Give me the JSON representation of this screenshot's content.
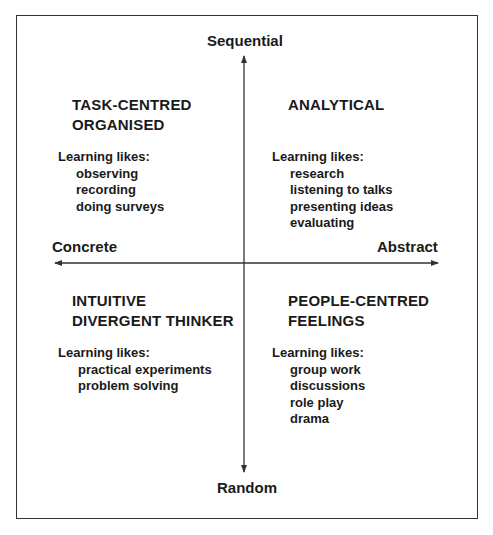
{
  "axes": {
    "top": "Sequential",
    "bottom": "Random",
    "left": "Concrete",
    "right": "Abstract"
  },
  "quadrants": [
    {
      "position": "top-left",
      "title_lines": [
        "TASK-CENTRED",
        "ORGANISED"
      ],
      "likes_label": "Learning likes:",
      "items": [
        "observing",
        "recording",
        "doing surveys"
      ]
    },
    {
      "position": "top-right",
      "title_lines": [
        "ANALYTICAL"
      ],
      "likes_label": "Learning likes:",
      "items": [
        "research",
        "listening to talks",
        "presenting ideas",
        "evaluating"
      ]
    },
    {
      "position": "bottom-left",
      "title_lines": [
        "INTUITIVE",
        "DIVERGENT THINKER"
      ],
      "likes_label": "Learning likes:",
      "items": [
        "practical experiments",
        "problem solving"
      ]
    },
    {
      "position": "bottom-right",
      "title_lines": [
        "PEOPLE-CENTRED",
        "FEELINGS"
      ],
      "likes_label": "Learning likes:",
      "items": [
        "group work",
        "discussions",
        "role play",
        "drama"
      ]
    }
  ],
  "colors": {
    "line": "#333333",
    "text": "#1a1a1a",
    "background": "#ffffff"
  }
}
